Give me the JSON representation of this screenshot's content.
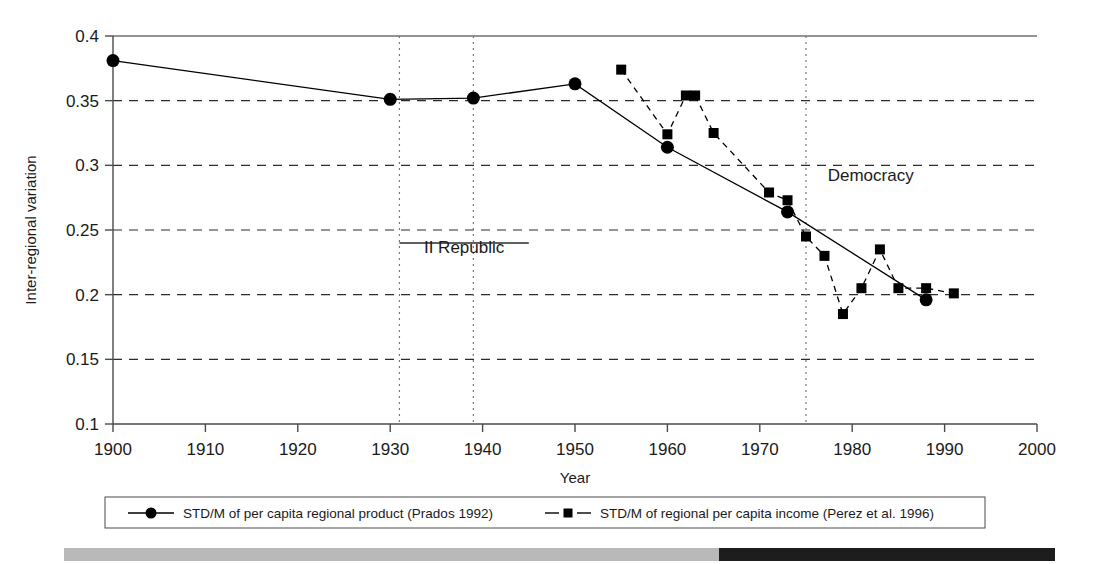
{
  "chart_data": {
    "type": "line",
    "title": "",
    "xlabel": "Year",
    "ylabel": "Inter-regional variation",
    "xlim": [
      1900,
      2000
    ],
    "ylim": [
      0.1,
      0.4
    ],
    "xticks": [
      1900,
      1910,
      1920,
      1930,
      1940,
      1950,
      1960,
      1970,
      1980,
      1990,
      2000
    ],
    "yticks": [
      0.1,
      0.15,
      0.2,
      0.25,
      0.3,
      0.35,
      0.4
    ],
    "grid": "horizontal-dashed",
    "legend_position": "below-axes",
    "series": [
      {
        "name": "STD/M of per capita regional product (Prados 1992)",
        "marker": "circle",
        "linestyle": "solid",
        "color": "#000000",
        "points": [
          {
            "x": 1900,
            "y": 0.381
          },
          {
            "x": 1930,
            "y": 0.351
          },
          {
            "x": 1939,
            "y": 0.352
          },
          {
            "x": 1950,
            "y": 0.363
          },
          {
            "x": 1960,
            "y": 0.314
          },
          {
            "x": 1973,
            "y": 0.264
          },
          {
            "x": 1988,
            "y": 0.196
          }
        ]
      },
      {
        "name": "STD/M of regional per capita income (Perez et al. 1996)",
        "marker": "square",
        "linestyle": "dashed",
        "color": "#000000",
        "points": [
          {
            "x": 1955,
            "y": 0.374
          },
          {
            "x": 1960,
            "y": 0.324
          },
          {
            "x": 1962,
            "y": 0.354
          },
          {
            "x": 1963,
            "y": 0.354
          },
          {
            "x": 1965,
            "y": 0.325
          },
          {
            "x": 1971,
            "y": 0.279
          },
          {
            "x": 1973,
            "y": 0.273
          },
          {
            "x": 1975,
            "y": 0.245
          },
          {
            "x": 1977,
            "y": 0.23
          },
          {
            "x": 1979,
            "y": 0.185
          },
          {
            "x": 1981,
            "y": 0.205
          },
          {
            "x": 1983,
            "y": 0.235
          },
          {
            "x": 1985,
            "y": 0.205
          },
          {
            "x": 1988,
            "y": 0.205
          },
          {
            "x": 1991,
            "y": 0.201
          }
        ]
      }
    ],
    "vertical_markers": [
      {
        "x": 1931
      },
      {
        "x": 1939
      },
      {
        "x": 1975
      }
    ],
    "annotations": [
      {
        "label": "II Republic",
        "x": 1938,
        "y": 0.232,
        "span": [
          1931,
          1945
        ],
        "span_y": 0.24
      },
      {
        "label": "Democracy",
        "x": 1982,
        "y": 0.288
      }
    ]
  },
  "legend": {
    "entries": [
      {
        "label": "STD/M of per capita regional product (Prados 1992)",
        "marker": "circle",
        "linestyle": "solid"
      },
      {
        "label": "STD/M of regional per capita income (Perez et al. 1996)",
        "marker": "square",
        "linestyle": "dashed"
      }
    ]
  }
}
